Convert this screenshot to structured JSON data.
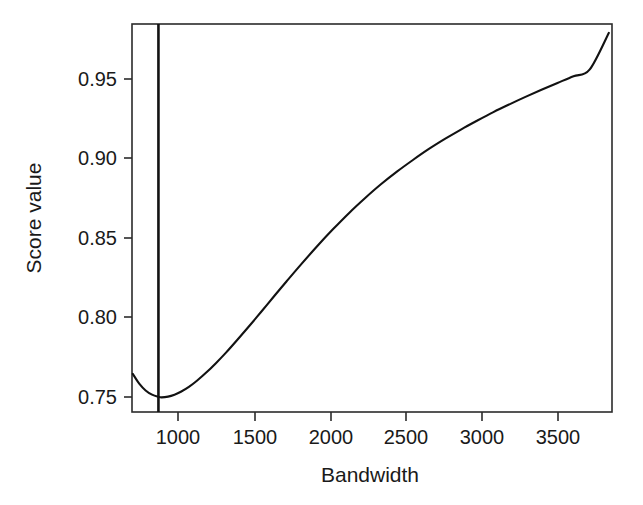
{
  "chart_data": {
    "type": "line",
    "title": "",
    "subtitle": "",
    "xlabel": "Bandwidth",
    "ylabel": "Score value",
    "xlim": [
      795,
      3790
    ],
    "ylim": [
      0.7405,
      0.98
    ],
    "grid": false,
    "legend": null,
    "x_ticks": [
      1000,
      1500,
      2000,
      2500,
      3000,
      3500
    ],
    "x_tick_labels": [
      "1000",
      "1500",
      "2000",
      "2500",
      "3000",
      "3500"
    ],
    "y_ticks": [
      0.75,
      0.8,
      0.85,
      0.9,
      0.95
    ],
    "y_tick_labels": [
      "0.75",
      "0.80",
      "0.85",
      "0.90",
      "0.95"
    ],
    "series": [
      {
        "name": "score",
        "color": "#121212",
        "x": [
          800,
          840,
          880,
          920,
          960,
          980,
          1020,
          1060,
          1100,
          1150,
          1200,
          1260,
          1320,
          1380,
          1450,
          1520,
          1600,
          1680,
          1760,
          1850,
          1950,
          2050,
          2150,
          2250,
          2350,
          2450,
          2550,
          2650,
          2750,
          2850,
          2950,
          3050,
          3150,
          3250,
          3350,
          3450,
          3550,
          3650,
          3770
        ],
        "y": [
          0.764,
          0.758,
          0.7538,
          0.7512,
          0.7498,
          0.7495,
          0.75,
          0.7512,
          0.753,
          0.756,
          0.7598,
          0.765,
          0.7708,
          0.777,
          0.7848,
          0.7928,
          0.8022,
          0.8118,
          0.8212,
          0.8316,
          0.8428,
          0.8534,
          0.8634,
          0.8726,
          0.8812,
          0.889,
          0.8962,
          0.903,
          0.9092,
          0.915,
          0.9204,
          0.9256,
          0.9304,
          0.935,
          0.9394,
          0.9436,
          0.9478,
          0.9518,
          0.9745
        ]
      }
    ],
    "annotations": [
      {
        "type": "vertical-line",
        "name": "optimal-bandwidth-line",
        "x": 960,
        "color": "#121212",
        "label": ""
      }
    ],
    "markers": [
      {
        "name": "curve-minimum",
        "x": 980,
        "y": 0.7495
      }
    ]
  },
  "axes": {
    "x_axis_title": "Bandwidth",
    "y_axis_title": "Score value"
  }
}
